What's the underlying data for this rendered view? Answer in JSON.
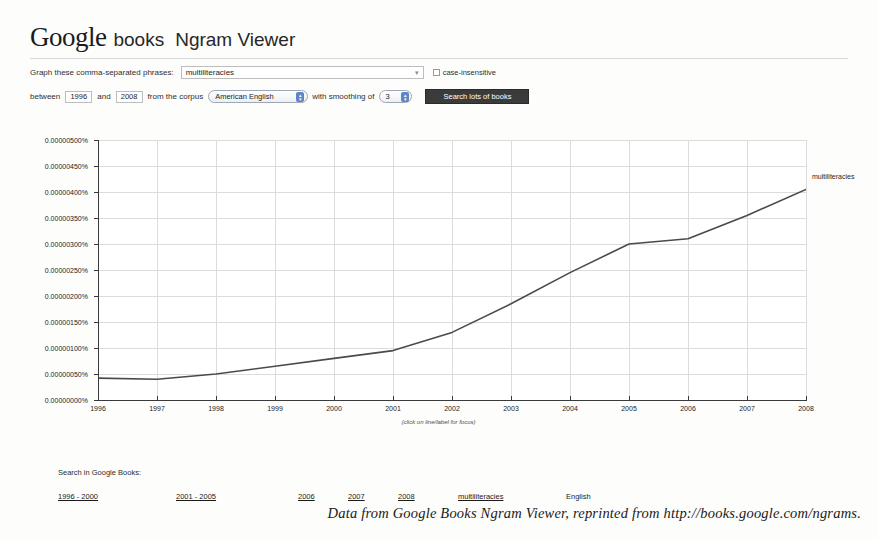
{
  "header": {
    "logo_google": "Google",
    "logo_books": "books",
    "title": "Ngram Viewer"
  },
  "form": {
    "phrases_label": "Graph these comma-separated phrases:",
    "phrases_value": "multiliteracies",
    "phrases_placeholder": "multiliteracies",
    "dropdown_caret": "▾",
    "case_insensitive_label": "case-insensitive",
    "case_insensitive_checked": false,
    "between_label": "between",
    "start_year": "1996",
    "and_label": "and",
    "end_year": "2008",
    "corpus_label": "from the corpus",
    "corpus_value": "American English",
    "smoothing_label": "with smoothing of",
    "smoothing_value": "3",
    "search_button": "Search lots of books"
  },
  "chart_data": {
    "type": "line",
    "title": "",
    "xlabel": "",
    "ylabel": "",
    "hint": "(click on line/label for focus)",
    "series_label": "multiliteracies",
    "x": [
      1996,
      1997,
      1998,
      1999,
      2000,
      2001,
      2002,
      2003,
      2004,
      2005,
      2006,
      2007,
      2008
    ],
    "categories": [
      "1996",
      "1997",
      "1998",
      "1999",
      "2000",
      "2001",
      "2002",
      "2003",
      "2004",
      "2005",
      "2006",
      "2007",
      "2008"
    ],
    "series": [
      {
        "name": "multiliteracies",
        "values": [
          4.2e-07,
          4e-07,
          5e-07,
          6.5e-07,
          8e-07,
          9.5e-07,
          1.3e-06,
          1.85e-06,
          2.45e-06,
          3e-06,
          3.1e-06,
          3.55e-06,
          4.05e-06
        ]
      }
    ],
    "ytick_labels": [
      "0.00000000%",
      "0.00000050%",
      "0.00000100%",
      "0.00000150%",
      "0.00000200%",
      "0.00000250%",
      "0.00000300%",
      "0.00000350%",
      "0.00000400%",
      "0.00000450%",
      "0.00000500%"
    ],
    "ytick_values": [
      0,
      5e-07,
      1e-06,
      1.5e-06,
      2e-06,
      2.5e-06,
      3e-06,
      3.5e-06,
      4e-06,
      4.5e-06,
      5e-06
    ],
    "ylim": [
      0,
      5e-06
    ],
    "xlim": [
      1996,
      2008
    ],
    "grid": true,
    "legend_position": "inline-right",
    "line_color": "#4a4a4a"
  },
  "footer": {
    "search_title": "Search in Google Books:",
    "links": [
      "1996 - 2000",
      "2001 - 2005",
      "2006",
      "2007",
      "2008",
      "multiliteracies"
    ],
    "language": "English"
  },
  "caption": "Data from Google Books Ngram Viewer, reprinted from http://books.google.com/ngrams."
}
